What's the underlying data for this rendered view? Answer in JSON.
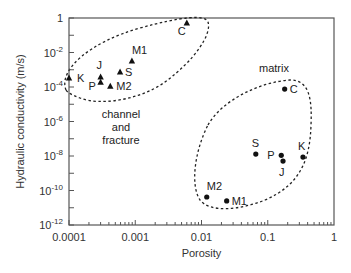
{
  "chart_data": {
    "type": "scatter",
    "title": "",
    "xlabel": "Porosity",
    "ylabel": "Hydraulic conductivity (m/s)",
    "xscale": "log",
    "yscale": "log",
    "xlim": [
      0.0001,
      1
    ],
    "ylim": [
      1e-12,
      1
    ],
    "grid": false,
    "legend": null,
    "x_ticks": [
      {
        "value": 0.0001,
        "label": "0.0001"
      },
      {
        "value": 0.001,
        "label": "0.001"
      },
      {
        "value": 0.01,
        "label": "0.01"
      },
      {
        "value": 0.1,
        "label": "0.1"
      },
      {
        "value": 1,
        "label": "1"
      }
    ],
    "y_ticks": [
      {
        "value": 1,
        "base": "1",
        "exp": ""
      },
      {
        "value": 0.01,
        "base": "10",
        "exp": "-2"
      },
      {
        "value": 0.0001,
        "base": "10",
        "exp": "-4"
      },
      {
        "value": 1e-06,
        "base": "10",
        "exp": "-6"
      },
      {
        "value": 1e-08,
        "base": "10",
        "exp": "-8"
      },
      {
        "value": 1e-10,
        "base": "10",
        "exp": "-10"
      },
      {
        "value": 1e-12,
        "base": "10",
        "exp": "-12"
      }
    ],
    "series": [
      {
        "name": "channel and fracture",
        "marker": "triangle",
        "points": [
          {
            "label": "K",
            "x": 0.0001,
            "y": 0.00033,
            "label_dx": 8,
            "label_dy": 4
          },
          {
            "label": "J",
            "x": 0.0003,
            "y": 0.00038,
            "label_dx": -4,
            "label_dy": -8
          },
          {
            "label": "P",
            "x": 0.0003,
            "y": 0.00019,
            "label_dx": -12,
            "label_dy": 8
          },
          {
            "label": "M2",
            "x": 0.00042,
            "y": 0.00011,
            "label_dx": 6,
            "label_dy": 4
          },
          {
            "label": "S",
            "x": 0.00059,
            "y": 0.00074,
            "label_dx": 5,
            "label_dy": 4
          },
          {
            "label": "M1",
            "x": 0.00089,
            "y": 0.0032,
            "label_dx": 0,
            "label_dy": -7
          },
          {
            "label": "C",
            "x": 0.006,
            "y": 0.51,
            "label_dx": -9,
            "label_dy": 12
          }
        ]
      },
      {
        "name": "matrix",
        "marker": "circle",
        "points": [
          {
            "label": "C",
            "x": 0.18,
            "y": 7.6e-05,
            "label_dx": 5,
            "label_dy": 4
          },
          {
            "label": "S",
            "x": 0.066,
            "y": 1.3e-08,
            "label_dx": -4,
            "label_dy": -7
          },
          {
            "label": "P",
            "x": 0.16,
            "y": 1.1e-08,
            "label_dx": -14,
            "label_dy": 4
          },
          {
            "label": "J",
            "x": 0.17,
            "y": 5.1e-09,
            "label_dx": -4,
            "label_dy": 15
          },
          {
            "label": "K",
            "x": 0.34,
            "y": 8.7e-09,
            "label_dx": -5,
            "label_dy": -7
          },
          {
            "label": "M2",
            "x": 0.012,
            "y": 4.2e-11,
            "label_dx": 0,
            "label_dy": -7
          },
          {
            "label": "M1",
            "x": 0.024,
            "y": 2.5e-11,
            "label_dx": 5,
            "label_dy": 4
          }
        ]
      }
    ],
    "annotations": [
      {
        "text_lines": [
          "channel",
          "and",
          "fracture"
        ],
        "x_px": 121,
        "y_px": 118
      },
      {
        "text_lines": [
          "matrix"
        ],
        "x_px": 274,
        "y_px": 72
      }
    ]
  },
  "layout": {
    "plot_left": 69,
    "plot_right": 334,
    "plot_top": 18,
    "plot_bottom": 225,
    "marker_color": "#111111",
    "axis_color": "#555555",
    "ellipse_color": "#222222"
  }
}
